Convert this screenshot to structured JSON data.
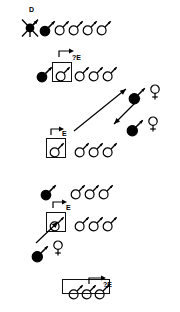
{
  "diagram": {
    "background_color": "#ffffff",
    "ink_color": "#000000",
    "symbol_legend": {
      "male_symbol": "mars-symbol",
      "female_symbol": "venus-symbol",
      "filled_male": "filled-mars-symbol",
      "open_male": "open-mars-symbol",
      "boxed_male": "boxed-mars-symbol",
      "dead_male": "crossed-mars-symbol"
    },
    "labels": [
      {
        "id": "lbl-d",
        "text": "D",
        "x": 29,
        "y": 6
      },
      {
        "id": "lbl-qe1",
        "text": "?E",
        "x": 72,
        "y": 54
      },
      {
        "id": "lbl-e1",
        "text": "E",
        "x": 62,
        "y": 130
      },
      {
        "id": "lbl-e2",
        "text": "E",
        "x": 66,
        "y": 204
      },
      {
        "id": "lbl-qe2",
        "text": "?E",
        "x": 103,
        "y": 281
      }
    ],
    "rows": [
      {
        "id": "row-1",
        "y": 22,
        "label": "D",
        "items": [
          {
            "kind": "crossed-mars-symbol",
            "fill": "solid",
            "x": 22
          },
          {
            "kind": "filled-mars-symbol",
            "fill": "solid",
            "x": 39
          },
          {
            "kind": "open-mars-symbol",
            "fill": "open",
            "x": 54
          },
          {
            "kind": "open-mars-symbol",
            "fill": "open",
            "x": 68
          },
          {
            "kind": "open-mars-symbol",
            "fill": "open",
            "x": 82
          },
          {
            "kind": "open-mars-symbol",
            "fill": "open",
            "x": 96
          }
        ]
      },
      {
        "id": "row-2",
        "y": 68,
        "label": "?E",
        "boxed_index": 1,
        "items": [
          {
            "kind": "filled-mars-symbol",
            "fill": "solid",
            "x": 36
          },
          {
            "kind": "boxed-mars-symbol",
            "fill": "open",
            "x": 52
          },
          {
            "kind": "open-mars-symbol",
            "fill": "open",
            "x": 74
          },
          {
            "kind": "open-mars-symbol",
            "fill": "open",
            "x": 88
          },
          {
            "kind": "open-mars-symbol",
            "fill": "open",
            "x": 102
          }
        ]
      },
      {
        "id": "row-3",
        "y": 144,
        "label": "E",
        "boxed_index": 0,
        "items": [
          {
            "kind": "boxed-mars-symbol",
            "fill": "open",
            "x": 46
          },
          {
            "kind": "open-mars-symbol",
            "fill": "open",
            "x": 74
          },
          {
            "kind": "open-mars-symbol",
            "fill": "open",
            "x": 88
          },
          {
            "kind": "open-mars-symbol",
            "fill": "open",
            "x": 102
          }
        ]
      },
      {
        "id": "row-4",
        "y": 186,
        "label": "",
        "items": [
          {
            "kind": "filled-mars-symbol",
            "fill": "solid",
            "x": 40
          },
          {
            "kind": "open-mars-symbol",
            "fill": "open",
            "x": 70
          },
          {
            "kind": "open-mars-symbol",
            "fill": "open",
            "x": 84
          },
          {
            "kind": "open-mars-symbol",
            "fill": "open",
            "x": 98
          }
        ]
      },
      {
        "id": "row-5",
        "y": 218,
        "label": "E",
        "boxed_index": 0,
        "items": [
          {
            "kind": "boxed-mars-symbol",
            "fill": "open",
            "x": 46
          },
          {
            "kind": "open-mars-symbol",
            "fill": "open",
            "x": 74
          },
          {
            "kind": "open-mars-symbol",
            "fill": "open",
            "x": 88
          },
          {
            "kind": "open-mars-symbol",
            "fill": "open",
            "x": 102
          }
        ]
      },
      {
        "id": "row-6",
        "y": 286,
        "label": "?E",
        "boxed_group": true,
        "items": [
          {
            "kind": "open-mars-symbol",
            "fill": "open",
            "x": 68
          },
          {
            "kind": "open-mars-symbol",
            "fill": "open",
            "x": 81
          },
          {
            "kind": "open-mars-symbol",
            "fill": "open",
            "x": 94
          }
        ]
      }
    ],
    "pairs": [
      {
        "id": "pair-upper-right",
        "male_x": 128,
        "male_y": 86,
        "female_x": 148,
        "female_y": 84
      },
      {
        "id": "pair-lower-right",
        "male_x": 126,
        "male_y": 118,
        "female_x": 146,
        "female_y": 116
      },
      {
        "id": "pair-lower-left",
        "male_x": 31,
        "male_y": 244,
        "female_x": 51,
        "female_y": 240
      }
    ],
    "arrows": [
      {
        "id": "arrow-migrate-up",
        "x1": 74,
        "y1": 131,
        "x2": 126,
        "y2": 89,
        "direction": "to-upper-right"
      },
      {
        "id": "arrow-migrate-down",
        "x1": 140,
        "y1": 98,
        "x2": 114,
        "y2": 124,
        "direction": "to-lower-left"
      },
      {
        "id": "arrow-migrate-in",
        "x1": 36,
        "y1": 243,
        "x2": 58,
        "y2": 222,
        "direction": "to-upper-right"
      }
    ]
  }
}
